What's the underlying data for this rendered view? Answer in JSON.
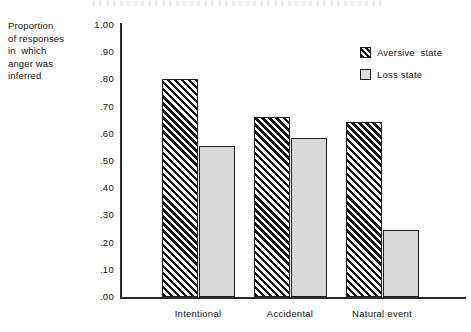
{
  "chart_data": {
    "type": "bar",
    "title": "",
    "xlabel": "",
    "ylabel": "Proportion of responses in which anger was inferred",
    "ylabel_lines": [
      "Proportion",
      "of responses",
      "in  which",
      "anger was",
      "inferred"
    ],
    "categories": [
      "Intentional",
      "Accidental",
      "Natural event"
    ],
    "series": [
      {
        "name": "Aversive  state",
        "values": [
          0.8,
          0.66,
          0.645
        ]
      },
      {
        "name": "Loss state",
        "values": [
          0.555,
          0.585,
          0.245
        ]
      }
    ],
    "ylim": [
      0.0,
      1.0
    ],
    "ytick_values": [
      1.0,
      0.9,
      0.8,
      0.7,
      0.6,
      0.5,
      0.4,
      0.3,
      0.2,
      0.1,
      0.0
    ],
    "ytick_labels": [
      "1.00",
      ".90",
      ".80",
      ".70",
      ".60",
      ".50",
      ".40",
      ".30",
      ".20",
      ".10",
      ".00"
    ],
    "grid": false,
    "legend_position": "upper right",
    "colors": {
      "aversive_fill": "#ffffff",
      "aversive_hatch": "#111111",
      "loss_fill": "#d9d9d9",
      "outline": "#1f1f1f",
      "axis": "#2b2b2b",
      "text": "#131313"
    }
  },
  "legend": {
    "items": [
      {
        "label": "Aversive  state",
        "swatch": "hatched-diagonal-swatch"
      },
      {
        "label": "Loss state",
        "swatch": "gray-swatch"
      }
    ]
  }
}
